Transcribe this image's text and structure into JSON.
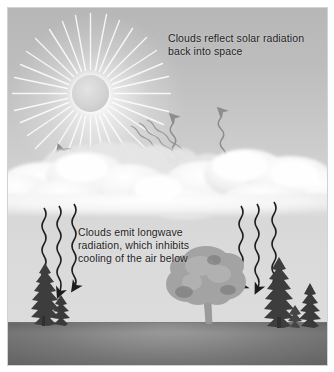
{
  "figure": {
    "kind": "illustration",
    "background_color": "#ffffff",
    "sky_color_top": "#b7b7b7",
    "sky_color_horizon": "#dcdcdc",
    "ground_color": "#8f8f8f",
    "cloud_color": "#f2f2f2",
    "text_color": "#1d1d1d"
  },
  "captions": {
    "top": "Clouds reflect solar radiation\nback into space",
    "bottom": "Clouds emit longwave\nradiation, which inhibits\ncooling of the air below"
  },
  "elements": {
    "sun_label": "sun",
    "cloud_label": "cloud bank",
    "ground_label": "ground",
    "deciduous_tree_label": "deciduous tree",
    "conifer_label": "conifer tree"
  },
  "arrows": {
    "incoming_solar": {
      "label": "incoming solar radiation",
      "count": 3,
      "direction": "down-right",
      "color": "#9a9a9a"
    },
    "reflected_up_right": {
      "label": "reflected solar radiation",
      "count": 2,
      "direction": "up-right",
      "color": "#8f8f8f"
    },
    "reflected_up_left": {
      "label": "reflected solar radiation",
      "count": 1,
      "direction": "up-left",
      "color": "#9a9a9a"
    },
    "longwave_left": {
      "label": "emitted longwave radiation",
      "count": 3,
      "direction": "down",
      "color": "#1d1d1d"
    },
    "longwave_right": {
      "label": "emitted longwave radiation",
      "count": 3,
      "direction": "down",
      "color": "#1d1d1d"
    }
  }
}
